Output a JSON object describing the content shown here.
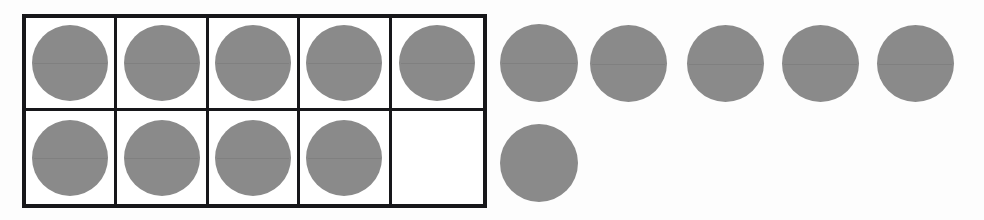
{
  "figure": {
    "kind": "ten-frame-counter-diagram",
    "counter_color": "#8a8a8a",
    "frame_border_color": "#17171a",
    "background_color": "#fdfdfd"
  },
  "ten_frame": {
    "columns": 5,
    "rows": 2,
    "x": 22,
    "y": 14,
    "width": 465,
    "height": 194,
    "cells": [
      {
        "row": 1,
        "col": 1,
        "filled": true
      },
      {
        "row": 1,
        "col": 2,
        "filled": true
      },
      {
        "row": 1,
        "col": 3,
        "filled": true
      },
      {
        "row": 1,
        "col": 4,
        "filled": true
      },
      {
        "row": 1,
        "col": 5,
        "filled": true
      },
      {
        "row": 2,
        "col": 1,
        "filled": true
      },
      {
        "row": 2,
        "col": 2,
        "filled": true
      },
      {
        "row": 2,
        "col": 3,
        "filled": true
      },
      {
        "row": 2,
        "col": 4,
        "filled": true
      },
      {
        "row": 2,
        "col": 5,
        "filled": false
      }
    ]
  },
  "loose_counters": [
    {
      "row": 1,
      "index": 1,
      "x": 500,
      "y": 24,
      "size": 78,
      "seam": true
    },
    {
      "row": 1,
      "index": 2,
      "x": 590,
      "y": 25,
      "size": 77,
      "seam": true
    },
    {
      "row": 1,
      "index": 3,
      "x": 687,
      "y": 25,
      "size": 77,
      "seam": true
    },
    {
      "row": 1,
      "index": 4,
      "x": 782,
      "y": 25,
      "size": 77,
      "seam": true
    },
    {
      "row": 1,
      "index": 5,
      "x": 877,
      "y": 25,
      "size": 77,
      "seam": true
    },
    {
      "row": 2,
      "index": 6,
      "x": 500,
      "y": 124,
      "size": 78,
      "seam": false
    }
  ],
  "counts": {
    "in_frame": 9,
    "outside_frame": 6,
    "empty_cells": 1,
    "total": 15
  },
  "chart_data": {
    "type": "table",
    "categories": [
      "In ten frame",
      "Outside ten frame",
      "Empty frame cells",
      "Total counters"
    ],
    "values": [
      9,
      6,
      1,
      15
    ],
    "xlabel": "",
    "ylabel": "Counters",
    "grid": true,
    "legend": "none"
  }
}
